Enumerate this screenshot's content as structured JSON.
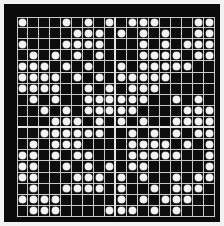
{
  "figure": {
    "title": "Dot matrix grid pattern",
    "colors": {
      "frame": "#0a0a0a",
      "cell_background": "#0d0d0d",
      "grid_line": "#c9c9c9",
      "separator_line": "#e6e6e6",
      "dot": "#f4f4f4",
      "page_background": "#f2f2f2"
    }
  },
  "grid": {
    "rows": 18,
    "cols": 18,
    "cell_size_px": 11,
    "separator_after_col": 9,
    "separator_after_row": 10,
    "dot_shape": "circle",
    "legend": {
      "filled": "1 = white dot present",
      "empty": "0 = empty black cell"
    },
    "matrix": [
      [
        1,
        0,
        0,
        0,
        1,
        0,
        1,
        0,
        1,
        0,
        1,
        1,
        1,
        0,
        0,
        0,
        1,
        1
      ],
      [
        0,
        0,
        0,
        0,
        0,
        1,
        1,
        1,
        0,
        1,
        0,
        1,
        0,
        1,
        0,
        0,
        1,
        1
      ],
      [
        1,
        0,
        0,
        0,
        1,
        1,
        1,
        1,
        0,
        0,
        0,
        1,
        0,
        1,
        0,
        1,
        1,
        1
      ],
      [
        0,
        1,
        0,
        1,
        0,
        1,
        0,
        1,
        0,
        0,
        0,
        1,
        1,
        1,
        1,
        0,
        1,
        1
      ],
      [
        1,
        1,
        1,
        0,
        1,
        0,
        1,
        0,
        0,
        1,
        0,
        1,
        1,
        1,
        1,
        1,
        0,
        0
      ],
      [
        1,
        1,
        1,
        1,
        0,
        1,
        0,
        1,
        0,
        1,
        1,
        1,
        1,
        1,
        0,
        0,
        0,
        0
      ],
      [
        1,
        1,
        1,
        1,
        0,
        0,
        1,
        0,
        1,
        0,
        1,
        1,
        1,
        0,
        0,
        0,
        0,
        0
      ],
      [
        0,
        1,
        0,
        1,
        0,
        0,
        1,
        1,
        1,
        1,
        1,
        1,
        0,
        0,
        1,
        0,
        1,
        0
      ],
      [
        0,
        0,
        1,
        0,
        1,
        0,
        1,
        1,
        1,
        1,
        1,
        0,
        0,
        0,
        0,
        1,
        1,
        1
      ],
      [
        0,
        0,
        0,
        1,
        1,
        1,
        0,
        1,
        0,
        1,
        0,
        1,
        0,
        0,
        1,
        1,
        1,
        1
      ],
      [
        0,
        0,
        1,
        1,
        1,
        1,
        1,
        1,
        0,
        0,
        1,
        0,
        1,
        0,
        1,
        0,
        1,
        1
      ],
      [
        0,
        1,
        0,
        1,
        1,
        1,
        0,
        0,
        0,
        0,
        1,
        1,
        1,
        1,
        0,
        1,
        0,
        1
      ],
      [
        1,
        1,
        0,
        1,
        0,
        1,
        1,
        0,
        0,
        0,
        1,
        1,
        1,
        1,
        1,
        0,
        0,
        1
      ],
      [
        1,
        1,
        0,
        0,
        1,
        0,
        1,
        0,
        1,
        0,
        1,
        1,
        0,
        0,
        0,
        0,
        0,
        1
      ],
      [
        1,
        1,
        0,
        0,
        0,
        1,
        1,
        1,
        0,
        1,
        0,
        1,
        0,
        0,
        1,
        0,
        1,
        1
      ],
      [
        0,
        1,
        0,
        0,
        1,
        1,
        1,
        1,
        0,
        1,
        0,
        0,
        1,
        0,
        1,
        1,
        1,
        0
      ],
      [
        1,
        1,
        1,
        1,
        0,
        0,
        0,
        0,
        0,
        1,
        0,
        1,
        0,
        1,
        1,
        1,
        0,
        0
      ],
      [
        0,
        1,
        1,
        1,
        0,
        0,
        0,
        0,
        1,
        1,
        1,
        0,
        1,
        0,
        1,
        0,
        0,
        0
      ]
    ]
  }
}
